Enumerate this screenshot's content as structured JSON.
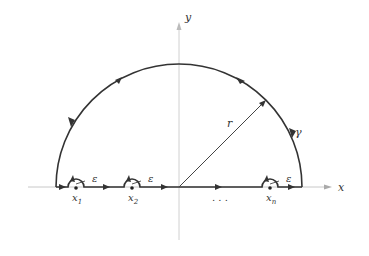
{
  "diagram": {
    "type": "contour-integral",
    "axes": {
      "x_label": "x",
      "y_label": "y"
    },
    "contour_label": "γ",
    "radius_label": "r",
    "indent_label": "ε",
    "points": [
      {
        "label": "x",
        "sub": "1"
      },
      {
        "label": "x",
        "sub": "2"
      },
      {
        "label": "x",
        "sub": "n"
      }
    ],
    "ellipsis": ". . .",
    "colors": {
      "curve": "#333333",
      "axis": "#bbbbbb"
    }
  }
}
